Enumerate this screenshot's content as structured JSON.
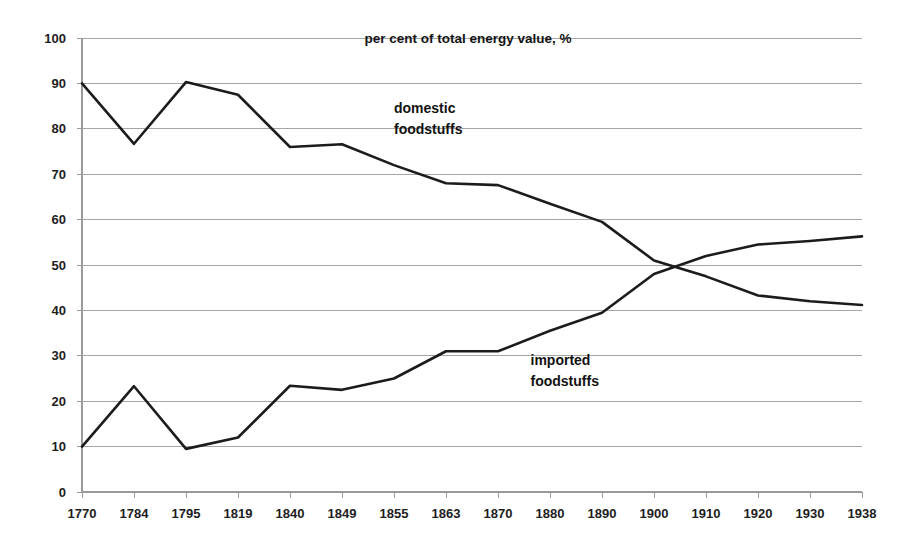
{
  "chart_data": {
    "type": "line",
    "title": "per cent of total energy value, %",
    "xlabel": "",
    "ylabel": "",
    "ylim": [
      0,
      100
    ],
    "ytick_step": 10,
    "grid": true,
    "legend": "inline-annotations",
    "categories": [
      "1770",
      "1784",
      "1795",
      "1819",
      "1840",
      "1849",
      "1855",
      "1863",
      "1870",
      "1880",
      "1890",
      "1900",
      "1910",
      "1920",
      "1930",
      "1938"
    ],
    "yticks": [
      "0",
      "10",
      "20",
      "30",
      "40",
      "50",
      "60",
      "70",
      "80",
      "90",
      "100"
    ],
    "series": [
      {
        "name": "domestic foodstuffs",
        "label_line1": "domestic",
        "label_line2": "foodstuffs",
        "color": "#1c1c1c",
        "values": [
          90.0,
          76.7,
          90.3,
          87.5,
          76.0,
          76.6,
          72.0,
          68.0,
          67.6,
          63.5,
          59.5,
          51.0,
          47.5,
          43.3,
          42.0,
          41.2
        ]
      },
      {
        "name": "imported foodstuffs",
        "label_line1": "imported",
        "label_line2": "foodstuffs",
        "color": "#1c1c1c",
        "values": [
          10.0,
          23.3,
          9.5,
          12.0,
          23.4,
          22.5,
          25.0,
          31.0,
          31.0,
          35.5,
          39.5,
          48.0,
          52.0,
          54.5,
          55.3,
          56.3
        ]
      }
    ],
    "annotations": [
      {
        "text": "domestic foodstuffs",
        "x_frac": 0.4,
        "y_value": 83.5
      },
      {
        "text": "imported foodstuffs",
        "x_frac": 0.575,
        "y_value": 28.0
      }
    ]
  },
  "plot_geometry": {
    "left_px": 82,
    "right_px": 862,
    "top_px": 38,
    "bottom_px": 492
  }
}
